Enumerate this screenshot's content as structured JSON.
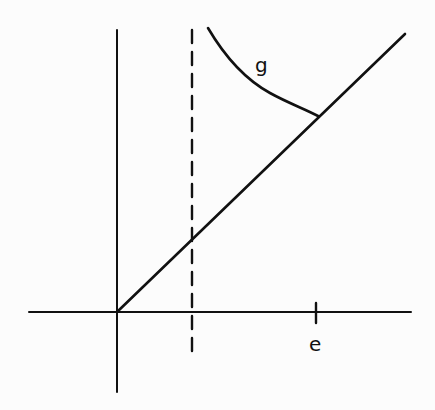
{
  "diagram": {
    "type": "function-graph",
    "labels": {
      "curve": "g",
      "x_tick": "e"
    },
    "colors": {
      "ink": "#111111",
      "background": "#fcfcfc"
    },
    "elements": [
      {
        "id": "x-axis",
        "kind": "line",
        "from": [
          29,
          312
        ],
        "to": [
          411,
          312
        ]
      },
      {
        "id": "y-axis",
        "kind": "line",
        "from": [
          117,
          30
        ],
        "to": [
          117,
          392
        ]
      },
      {
        "id": "diagonal",
        "kind": "line",
        "from": [
          117,
          312
        ],
        "to": [
          405,
          34
        ]
      },
      {
        "id": "asymptote",
        "kind": "dashed-line",
        "from": [
          192,
          30
        ],
        "to": [
          192,
          357
        ]
      },
      {
        "id": "curve-g",
        "kind": "curve",
        "from": [
          208,
          28
        ],
        "to": [
          318,
          116
        ],
        "label": "g"
      },
      {
        "id": "tick-e",
        "kind": "tick",
        "at": [
          316,
          312
        ],
        "label": "e"
      }
    ]
  }
}
